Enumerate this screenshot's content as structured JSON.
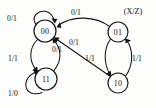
{
  "diagram": {
    "kind": "finite-state-machine",
    "legend": {
      "text": "(X/Z)",
      "x": 133,
      "y": 11
    },
    "colors": {
      "stroke": "#141414",
      "text": "#111111",
      "background": "#fdfdfb"
    },
    "states": [
      {
        "id": "s00",
        "label": "00",
        "cx": 45,
        "cy": 31,
        "r": 11
      },
      {
        "id": "s01",
        "label": "01",
        "cx": 118,
        "cy": 32,
        "r": 10
      },
      {
        "id": "s11",
        "label": "11",
        "cx": 46,
        "cy": 79,
        "r": 11
      },
      {
        "id": "s10",
        "label": "10",
        "cx": 118,
        "cy": 83,
        "r": 10
      }
    ],
    "transitions": [
      {
        "id": "t-00-00",
        "from": "00",
        "to": "00",
        "label": "0/1",
        "label_x": 12,
        "label_y": 18,
        "kind": "self-loop"
      },
      {
        "id": "t-01-00",
        "from": "01",
        "to": "00",
        "label": "0/1",
        "label_x": 76,
        "label_y": 12,
        "kind": "arc"
      },
      {
        "id": "t-00-11",
        "from": "00",
        "to": "11",
        "label": "1/1",
        "label_x": 13,
        "label_y": 58,
        "kind": "arc"
      },
      {
        "id": "t-11-00",
        "from": "11",
        "to": "00",
        "label": "0/1",
        "label_x": 57,
        "label_y": 49,
        "kind": "arc"
      },
      {
        "id": "t-10-00",
        "from": "10",
        "to": "00",
        "label": "0/1",
        "label_x": 74,
        "label_y": 42,
        "kind": "line"
      },
      {
        "id": "t-01-10",
        "from": "01",
        "to": "10",
        "label": "1/1",
        "label_x": 90,
        "label_y": 58,
        "kind": "arc"
      },
      {
        "id": "t-10-01",
        "from": "10",
        "to": "01",
        "label": "1/1",
        "label_x": 137,
        "label_y": 58,
        "kind": "arc"
      },
      {
        "id": "t-11-11",
        "from": "11",
        "to": "11",
        "label": "1/0",
        "label_x": 13,
        "label_y": 93,
        "kind": "self-loop"
      }
    ]
  }
}
